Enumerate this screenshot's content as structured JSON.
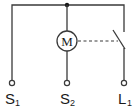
{
  "diagram": {
    "type": "electrical-schematic",
    "motor_label": "M",
    "terminals": [
      {
        "id": "S1",
        "letter": "S",
        "subscript": "1"
      },
      {
        "id": "S2",
        "letter": "S",
        "subscript": "2"
      },
      {
        "id": "L1",
        "letter": "L",
        "subscript": "1"
      }
    ],
    "components": [
      "junction",
      "motor",
      "switch",
      "mechanical-linkage"
    ]
  }
}
